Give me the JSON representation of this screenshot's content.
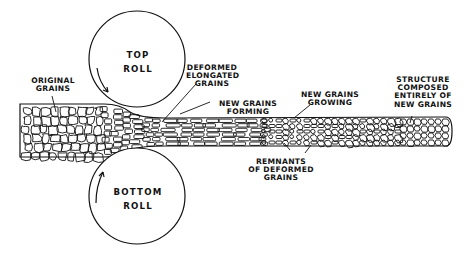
{
  "diagram": {
    "rolls": {
      "top": {
        "line1": "TOP",
        "line2": "ROLL",
        "cx": 137,
        "cy": 59,
        "r": 48,
        "rotation": "clockwise"
      },
      "bottom": {
        "line1": "BOTTOM",
        "line2": "ROLL",
        "cx": 137,
        "cy": 196,
        "r": 48,
        "rotation": "counterclockwise"
      }
    },
    "labels": {
      "original_grains": [
        "ORIGINAL",
        "GRAINS"
      ],
      "deformed_elongated_grains": [
        "DEFORMED",
        "ELONGATED",
        "GRAINS"
      ],
      "new_grains_forming": [
        "NEW GRAINS",
        "FORMING"
      ],
      "new_grains_growing": [
        "NEW GRAINS",
        "GROWING"
      ],
      "remnants_of_deformed_grains": [
        "REMNANTS",
        "OF DEFORMED",
        "GRAINS"
      ],
      "structure_new_grains": [
        "STRUCTURE",
        "COMPOSED",
        "ENTIRELY  OF",
        "NEW GRAINS"
      ]
    },
    "colors": {
      "ink": "#111111",
      "paper": "#ffffff"
    }
  }
}
